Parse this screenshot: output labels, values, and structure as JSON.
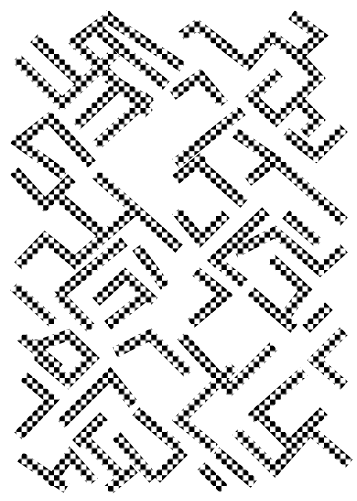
{
  "artwork": {
    "description": "Black-on-white pixel checkerboard ornament of interlocking diagonal bands",
    "background": "#ffffff",
    "foreground": "#000000",
    "cell_size": 5.4,
    "band_width": 11,
    "strokes": [
      [
        [
          20,
          62
        ],
        [
          62,
          104
        ]
      ],
      [
        [
          38,
          42
        ],
        [
          78,
          80
        ]
      ],
      [
        [
          62,
          104
        ],
        [
          112,
          56
        ]
      ],
      [
        [
          75,
          42
        ],
        [
          108,
          18
        ]
      ],
      [
        [
          75,
          42
        ],
        [
          145,
          110
        ]
      ],
      [
        [
          108,
          18
        ],
        [
          178,
          64
        ]
      ],
      [
        [
          100,
          32
        ],
        [
          162,
          82
        ]
      ],
      [
        [
          80,
          122
        ],
        [
          118,
          86
        ]
      ],
      [
        [
          100,
          142
        ],
        [
          146,
          100
        ]
      ],
      [
        [
          112,
          80
        ],
        [
          146,
          100
        ]
      ],
      [
        [
          22,
          140
        ],
        [
          50,
          118
        ],
        [
          88,
          160
        ]
      ],
      [
        [
          18,
          142
        ],
        [
          60,
          172
        ]
      ],
      [
        [
          186,
          33
        ],
        [
          197,
          25
        ],
        [
          248,
          64
        ],
        [
          272,
          36
        ],
        [
          298,
          56
        ]
      ],
      [
        [
          296,
          18
        ],
        [
          320,
          36
        ],
        [
          298,
          56
        ]
      ],
      [
        [
          298,
          56
        ],
        [
          318,
          78
        ]
      ],
      [
        [
          252,
          98
        ],
        [
          275,
          76
        ]
      ],
      [
        [
          252,
          98
        ],
        [
          276,
          120
        ],
        [
          316,
          80
        ]
      ],
      [
        [
          298,
          100
        ],
        [
          318,
          120
        ],
        [
          308,
          130
        ]
      ],
      [
        [
          290,
          136
        ],
        [
          316,
          156
        ],
        [
          340,
          132
        ]
      ],
      [
        [
          177,
          92
        ],
        [
          200,
          76
        ],
        [
          220,
          100
        ]
      ],
      [
        [
          180,
          160
        ],
        [
          238,
          114
        ]
      ],
      [
        [
          240,
          136
        ],
        [
          275,
          160
        ]
      ],
      [
        [
          18,
          175
        ],
        [
          45,
          205
        ],
        [
          68,
          182
        ]
      ],
      [
        [
          100,
          178
        ],
        [
          175,
          245
        ]
      ],
      [
        [
          60,
          198
        ],
        [
          100,
          232
        ]
      ],
      [
        [
          22,
          262
        ],
        [
          45,
          238
        ],
        [
          75,
          262
        ]
      ],
      [
        [
          75,
          262
        ],
        [
          130,
          214
        ]
      ],
      [
        [
          62,
          292
        ],
        [
          120,
          245
        ]
      ],
      [
        [
          18,
          290
        ],
        [
          50,
          320
        ]
      ],
      [
        [
          140,
          252
        ],
        [
          162,
          282
        ]
      ],
      [
        [
          62,
          298
        ],
        [
          88,
          325
        ]
      ],
      [
        [
          100,
          298
        ],
        [
          125,
          275
        ],
        [
          150,
          298
        ]
      ],
      [
        [
          112,
          322
        ],
        [
          140,
          300
        ]
      ],
      [
        [
          180,
          176
        ],
        [
          200,
          160
        ]
      ],
      [
        [
          200,
          165
        ],
        [
          240,
          200
        ]
      ],
      [
        [
          180,
          215
        ],
        [
          200,
          240
        ],
        [
          222,
          218
        ]
      ],
      [
        [
          252,
          178
        ],
        [
          275,
          160
        ],
        [
          340,
          218
        ]
      ],
      [
        [
          290,
          218
        ],
        [
          315,
          240
        ]
      ],
      [
        [
          215,
          260
        ],
        [
          262,
          215
        ]
      ],
      [
        [
          215,
          260
        ],
        [
          240,
          280
        ]
      ],
      [
        [
          240,
          250
        ],
        [
          275,
          232
        ],
        [
          320,
          270
        ],
        [
          340,
          252
        ]
      ],
      [
        [
          275,
          262
        ],
        [
          305,
          290
        ],
        [
          290,
          310
        ]
      ],
      [
        [
          255,
          295
        ],
        [
          290,
          325
        ]
      ],
      [
        [
          310,
          325
        ],
        [
          325,
          310
        ]
      ],
      [
        [
          200,
          275
        ],
        [
          225,
          295
        ],
        [
          195,
          320
        ]
      ],
      [
        [
          40,
          345
        ],
        [
          68,
          335
        ],
        [
          92,
          358
        ],
        [
          68,
          382
        ],
        [
          40,
          358
        ],
        [
          40,
          345
        ]
      ],
      [
        [
          25,
          340
        ],
        [
          55,
          365
        ]
      ],
      [
        [
          28,
          380
        ],
        [
          52,
          400
        ],
        [
          22,
          432
        ]
      ],
      [
        [
          65,
          420
        ],
        [
          110,
          375
        ],
        [
          130,
          400
        ]
      ],
      [
        [
          80,
          440
        ],
        [
          100,
          420
        ]
      ],
      [
        [
          85,
          440
        ],
        [
          115,
          470
        ]
      ],
      [
        [
          140,
          415
        ],
        [
          175,
          445
        ]
      ],
      [
        [
          25,
          460
        ],
        [
          62,
          485
        ]
      ],
      [
        [
          52,
          480
        ],
        [
          70,
          455
        ],
        [
          90,
          478
        ]
      ],
      [
        [
          112,
          487
        ],
        [
          130,
          472
        ]
      ],
      [
        [
          120,
          440
        ],
        [
          150,
          475
        ]
      ],
      [
        [
          160,
          475
        ],
        [
          180,
          455
        ]
      ],
      [
        [
          120,
          350
        ],
        [
          150,
          335
        ],
        [
          185,
          370
        ]
      ],
      [
        [
          185,
          340
        ],
        [
          230,
          390
        ],
        [
          270,
          350
        ]
      ],
      [
        [
          180,
          420
        ],
        [
          230,
          370
        ]
      ],
      [
        [
          180,
          420
        ],
        [
          210,
          445
        ]
      ],
      [
        [
          255,
          415
        ],
        [
          300,
          375
        ]
      ],
      [
        [
          258,
          412
        ],
        [
          290,
          445
        ],
        [
          320,
          415
        ]
      ],
      [
        [
          240,
          435
        ],
        [
          275,
          470
        ],
        [
          310,
          430
        ],
        [
          345,
          460
        ]
      ],
      [
        [
          220,
          455
        ],
        [
          250,
          480
        ]
      ],
      [
        [
          205,
          470
        ],
        [
          220,
          485
        ]
      ],
      [
        [
          315,
          360
        ],
        [
          340,
          335
        ]
      ],
      [
        [
          315,
          360
        ],
        [
          340,
          382
        ]
      ]
    ]
  }
}
